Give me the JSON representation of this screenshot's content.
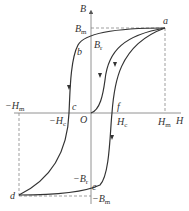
{
  "diagram": {
    "axes": {
      "x_label": "H",
      "y_label": "B",
      "origin_label": "O"
    },
    "points": {
      "a": "a",
      "b": "b",
      "c": "c",
      "d": "d",
      "e": "e",
      "f": "f"
    },
    "ticks": {
      "Bm": "B",
      "Bm_sub": "m",
      "Br": "B",
      "Br_sub": "r",
      "negHm": "−H",
      "negHm_sub": "m",
      "negHc": "−H",
      "negHc_sub": "c",
      "Hc": "H",
      "Hc_sub": "c",
      "Hm": "H",
      "Hm_sub": "m",
      "negBr": "−B",
      "negBr_sub": "r",
      "negBm": "−B",
      "negBm_sub": "m"
    },
    "colors": {
      "curve": "#333333",
      "axis": "#555555",
      "dash": "#777777"
    }
  }
}
